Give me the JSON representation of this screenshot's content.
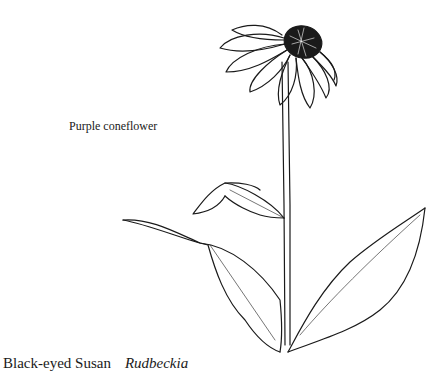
{
  "labels": {
    "annotation": "Purple coneflower",
    "common_name": "Black-eyed Susan",
    "scientific_name": "Rudbeckia"
  },
  "illustration": {
    "subject": "flower-line-drawing",
    "stroke_color": "#1a1a1a",
    "center_color": "#1a1a1a"
  }
}
